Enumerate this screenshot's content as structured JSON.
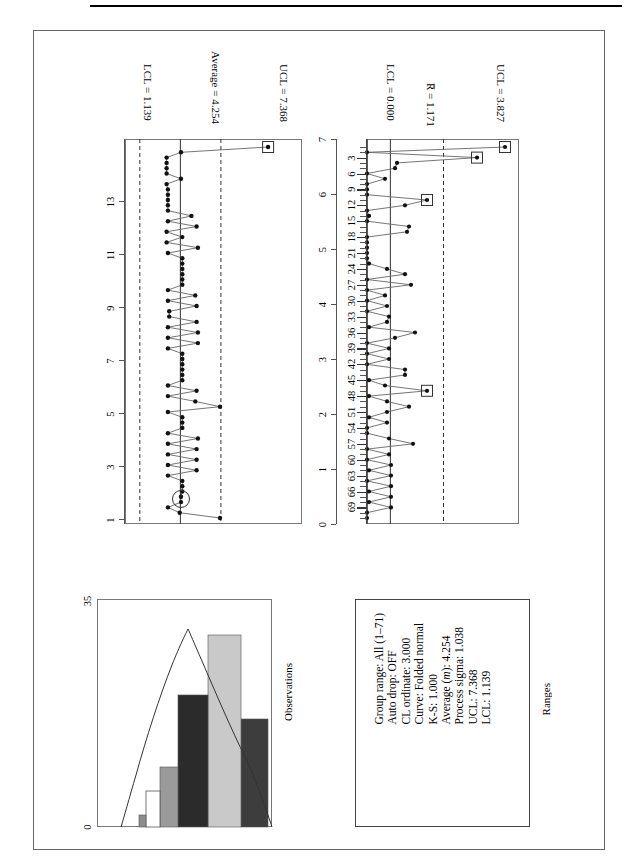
{
  "page": {
    "orientation": "rotated-90-ccw",
    "background": "#ffffff"
  },
  "observations_chart": {
    "y_axis_title": "",
    "tick_labels": [
      "1",
      "3",
      "5",
      "7",
      "9",
      "11",
      "13"
    ],
    "annotations": {
      "ucl": "UCL = 7.368",
      "center": "Average = 4.254",
      "lcl": "LCL = 1.139"
    }
  },
  "ranges_chart": {
    "tick_labels_y": [
      "0",
      "1",
      "2",
      "3",
      "4",
      "5",
      "6",
      "7"
    ],
    "tick_labels_x": [
      "3",
      "6",
      "9",
      "12",
      "15",
      "18",
      "21",
      "24",
      "27",
      "30",
      "33",
      "36",
      "39",
      "42",
      "45",
      "48",
      "51",
      "54",
      "57",
      "60",
      "63",
      "66",
      "69"
    ],
    "annotations": {
      "ucl": "UCL = 3.827",
      "center": "R̅ = 1.171",
      "lcl": "LCL = 0.000"
    }
  },
  "histogram": {
    "title": "Observations",
    "axis_min_label": "0",
    "axis_max_label": "35"
  },
  "stats_panel": {
    "title": "Ranges",
    "lines": [
      "Group range: All (1–71)",
      "Auto drop: OFF",
      "CL ordinate: 3.000",
      "Curve: Folded normal",
      "K-S: 1.000",
      "Average (m): 4.254",
      "Process sigma: 1.038",
      "UCL: 7.368",
      "LCL: 1.139"
    ]
  },
  "chart_data": [
    {
      "type": "line",
      "name": "Observations control chart (X chart)",
      "title": "Observations",
      "xlabel": "Observation number",
      "ylabel": "Observations",
      "ylim": [
        0,
        13.6
      ],
      "yticks": [
        1,
        3,
        5,
        7,
        9,
        11,
        13
      ],
      "xlim": [
        0.5,
        71.5
      ],
      "grid": false,
      "center_line": 4.254,
      "ucl": 7.368,
      "lcl": 1.139,
      "center_label": "Average = 4.254",
      "ucl_label": "UCL = 7.368",
      "lcl_label": "LCL = 1.139",
      "out_of_control_points": [
        {
          "x": 1,
          "y": 11.0,
          "marker": "square"
        }
      ],
      "highlighted_points": [
        {
          "x": 67,
          "y": 4.3,
          "marker": "circle"
        }
      ],
      "x": [
        1,
        2,
        3,
        4,
        5,
        6,
        7,
        8,
        9,
        10,
        11,
        12,
        13,
        14,
        15,
        16,
        17,
        18,
        19,
        20,
        21,
        22,
        23,
        24,
        25,
        26,
        27,
        28,
        29,
        30,
        31,
        32,
        33,
        34,
        35,
        36,
        37,
        38,
        39,
        40,
        41,
        42,
        43,
        44,
        45,
        46,
        47,
        48,
        49,
        50,
        51,
        52,
        53,
        54,
        55,
        56,
        57,
        58,
        59,
        60,
        61,
        62,
        63,
        64,
        65,
        66,
        67,
        68,
        69,
        70,
        71
      ],
      "values": [
        11.0,
        4.3,
        3.2,
        3.2,
        3.2,
        3.2,
        4.3,
        3.2,
        3.3,
        3.3,
        3.3,
        3.3,
        3.3,
        5.1,
        3.3,
        5.5,
        3.2,
        4.4,
        3.2,
        5.6,
        3.3,
        4.4,
        4.4,
        4.4,
        4.4,
        4.4,
        4.4,
        3.3,
        5.4,
        3.3,
        5.5,
        3.4,
        3.4,
        5.5,
        3.3,
        5.6,
        3.3,
        5.6,
        3.3,
        4.4,
        4.4,
        4.4,
        4.4,
        4.4,
        4.4,
        3.3,
        5.5,
        3.3,
        5.4,
        7.3,
        3.3,
        4.4,
        4.4,
        4.4,
        3.3,
        5.6,
        3.3,
        5.5,
        3.3,
        5.5,
        3.3,
        5.5,
        3.3,
        4.4,
        4.4,
        4.4,
        4.3,
        4.3,
        3.3,
        4.2,
        7.3
      ]
    },
    {
      "type": "line",
      "name": "Ranges control chart (R chart)",
      "title": "Ranges",
      "xlabel": "Subgroup number",
      "ylabel": "Ranges",
      "ylim": [
        0,
        7.6
      ],
      "yticks": [
        0,
        1,
        2,
        3,
        4,
        5,
        6,
        7
      ],
      "xlim": [
        0.5,
        71.5
      ],
      "xticks": [
        3,
        6,
        9,
        12,
        15,
        18,
        21,
        24,
        27,
        30,
        33,
        36,
        39,
        42,
        45,
        48,
        51,
        54,
        57,
        60,
        63,
        66,
        69
      ],
      "grid": false,
      "center_line": 1.171,
      "ucl": 3.827,
      "lcl": 0.0,
      "center_label": "R̅ = 1.171",
      "ucl_label": "UCL = 3.827",
      "lcl_label": "LCL = 0.000",
      "out_of_control_points": [
        {
          "x": 1,
          "y": 6.9,
          "marker": "square"
        },
        {
          "x": 3,
          "y": 5.5,
          "marker": "square"
        },
        {
          "x": 11,
          "y": 3.0,
          "marker": "square"
        },
        {
          "x": 47,
          "y": 3.0,
          "marker": "square"
        }
      ],
      "x": [
        1,
        2,
        3,
        4,
        5,
        6,
        7,
        8,
        9,
        10,
        11,
        12,
        13,
        14,
        15,
        16,
        17,
        18,
        19,
        20,
        21,
        22,
        23,
        24,
        25,
        26,
        27,
        28,
        29,
        30,
        31,
        32,
        33,
        34,
        35,
        36,
        37,
        38,
        39,
        40,
        41,
        42,
        43,
        44,
        45,
        46,
        47,
        48,
        49,
        50,
        51,
        52,
        53,
        54,
        55,
        56,
        57,
        58,
        59,
        60,
        61,
        62,
        63,
        64,
        65,
        66,
        67,
        68,
        69,
        70,
        71
      ],
      "values": [
        6.9,
        0.0,
        5.5,
        1.5,
        1.4,
        0.0,
        0.9,
        0.0,
        0.0,
        0.0,
        3.0,
        1.9,
        0.0,
        0.1,
        0.0,
        2.1,
        2.0,
        0.0,
        0.0,
        0.0,
        0.0,
        0.0,
        0.1,
        1.0,
        1.9,
        0.0,
        2.2,
        0.0,
        0.9,
        0.0,
        1.0,
        0.0,
        1.1,
        1.0,
        0.1,
        2.4,
        1.4,
        0.0,
        1.1,
        0.0,
        1.1,
        0.0,
        1.9,
        1.9,
        0.1,
        0.9,
        3.0,
        0.1,
        1.0,
        2.1,
        1.0,
        0.1,
        1.0,
        0.0,
        0.0,
        1.1,
        2.3,
        0.0,
        1.1,
        0.0,
        1.2,
        0.1,
        1.2,
        0.0,
        1.2,
        0.1,
        1.2,
        0.1,
        1.2,
        0.0,
        0.0
      ]
    },
    {
      "type": "bar",
      "name": "Observations histogram",
      "title": "Observations",
      "xlabel": "",
      "ylabel": "Observations",
      "axis_labels": [
        "0",
        "35"
      ],
      "xlim": [
        0,
        35
      ],
      "bin_fill_colors": [
        "#3d3d3d",
        "#c9c9c9",
        "#2b2b2b",
        "#9a9a9a",
        "#ffffff",
        "#8c8c8c"
      ],
      "categories": [
        "bin1",
        "bin2",
        "bin3",
        "bin4",
        "bin5",
        "bin6"
      ],
      "values": [
        18,
        32,
        22,
        10,
        6,
        2
      ],
      "curve": "Folded normal fit overlay"
    }
  ]
}
